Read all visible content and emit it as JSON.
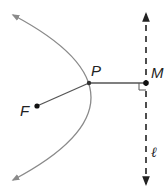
{
  "diagram": {
    "colors": {
      "parabola": "#8a8a8a",
      "segment": "#555555",
      "points": "#111111",
      "directrix": "#222222",
      "labels": "#222222"
    },
    "points": {
      "F": {
        "label": "F",
        "x": 37,
        "y": 106
      },
      "P": {
        "label": "P",
        "x": 89,
        "y": 83
      },
      "M": {
        "label": "M",
        "x": 146,
        "y": 83
      }
    },
    "directrix": {
      "label": "ℓ",
      "x": 146,
      "y_top": 12,
      "y_bottom": 186,
      "style": "dashed"
    },
    "parabola": {
      "opens": "left",
      "vertex_x": 91,
      "arrow_top": [
        13,
        15
      ],
      "arrow_bottom": [
        13,
        180
      ]
    },
    "segments": [
      {
        "from": "F",
        "to": "P"
      },
      {
        "from": "P",
        "to": "M"
      }
    ],
    "right_angle_marker": {
      "at": "M",
      "size": 7
    }
  }
}
